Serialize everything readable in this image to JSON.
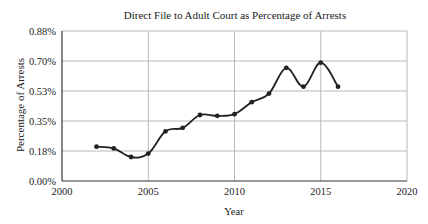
{
  "chart_data": {
    "type": "line",
    "title": "Direct File to Adult Court as Percentage of Arrests",
    "xlabel": "Year",
    "ylabel": "Percentage of Arrests",
    "xlim": [
      2000,
      2020
    ],
    "ylim": [
      0,
      0.875
    ],
    "x_ticks": [
      2000,
      2005,
      2010,
      2015,
      2020
    ],
    "y_ticks": [
      {
        "value": 0.0,
        "label": "0.00%"
      },
      {
        "value": 0.175,
        "label": "0.18%"
      },
      {
        "value": 0.35,
        "label": "0.35%"
      },
      {
        "value": 0.525,
        "label": "0.53%"
      },
      {
        "value": 0.7,
        "label": "0.70%"
      },
      {
        "value": 0.875,
        "label": "0.88%"
      }
    ],
    "grid": true,
    "legend": null,
    "series": [
      {
        "name": "Direct File to Adult Court (% of arrests)",
        "color": "#222222",
        "marker": "circle",
        "smooth": true,
        "x": [
          2002,
          2003,
          2004,
          2005,
          2006,
          2007,
          2008,
          2009,
          2010,
          2011,
          2012,
          2013,
          2014,
          2015,
          2016
        ],
        "values": [
          0.2,
          0.19,
          0.14,
          0.16,
          0.29,
          0.31,
          0.385,
          0.38,
          0.39,
          0.46,
          0.51,
          0.66,
          0.55,
          0.69,
          0.55
        ]
      }
    ]
  }
}
